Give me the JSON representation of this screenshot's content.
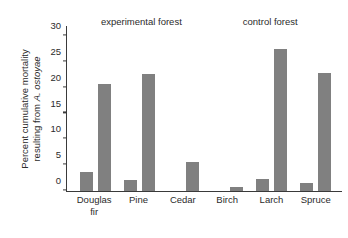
{
  "chart_data": {
    "type": "bar",
    "title": "",
    "subtitle": "",
    "xlabel": "",
    "ylabel": "Percent cumulative mortality resulting from A. ostoyae",
    "ylabel_line1": "Percent cumulative mortality",
    "ylabel_line2_prefix": "resulting from ",
    "ylabel_line2_species": "A. ostoyae",
    "categories": [
      "Douglas fir",
      "Pine",
      "Cedar",
      "Birch",
      "Larch",
      "Spruce"
    ],
    "category_lines": [
      [
        "Douglas",
        "fir"
      ],
      [
        "Pine",
        ""
      ],
      [
        "Cedar",
        ""
      ],
      [
        "Birch",
        ""
      ],
      [
        "Larch",
        ""
      ],
      [
        "Spruce",
        ""
      ]
    ],
    "series": [
      {
        "name": "experimental forest",
        "color": "#808080",
        "values": [
          3.7,
          2.2,
          0,
          0,
          2.4,
          1.5
        ]
      },
      {
        "name": "control forest",
        "color": "#808080",
        "values": [
          20.8,
          22.6,
          5.7,
          0.8,
          27.5,
          22.9
        ]
      }
    ],
    "ylim": [
      0,
      32
    ],
    "yticks": [
      0,
      5,
      10,
      15,
      20,
      25,
      30
    ],
    "ytick_labels": [
      "0",
      "5",
      "10",
      "15",
      "20",
      "25",
      "30"
    ],
    "grid": false,
    "legend_position": "top"
  },
  "legend": {
    "entries": [
      {
        "label": "experimental forest",
        "swatch_color": "#808080"
      },
      {
        "label": "control forest",
        "swatch_color": "#808080"
      }
    ]
  },
  "colors": {
    "bar": "#808080",
    "axis": "#3a3a3a",
    "text": "#2b2b2b",
    "background": "#ffffff"
  }
}
